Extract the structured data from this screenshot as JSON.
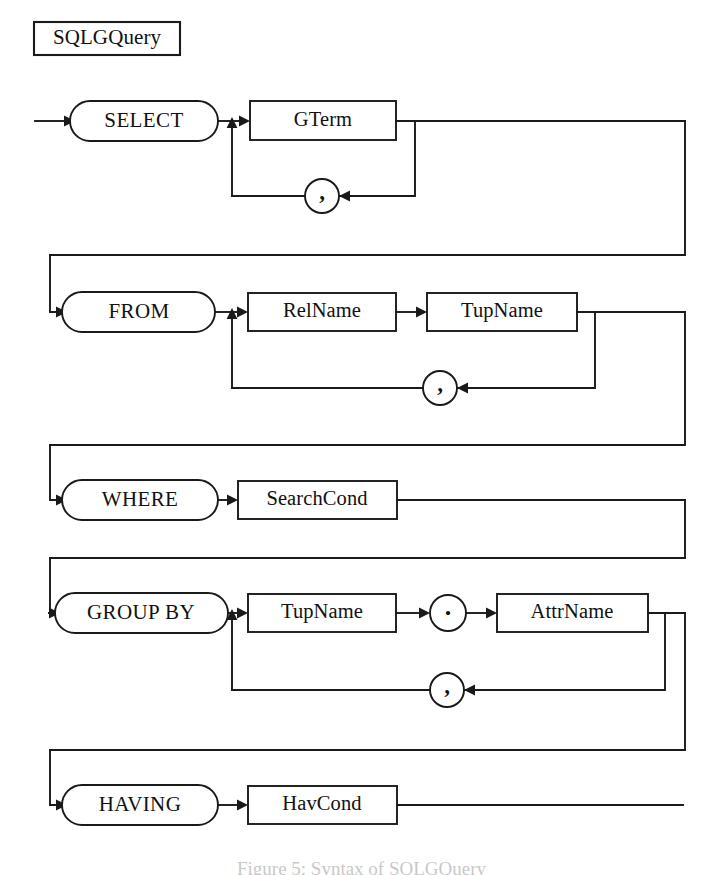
{
  "diagram": {
    "title": "SQLGQuery",
    "kind": "railroad-syntax-diagram",
    "caption": "Figure 5: Syntax of SQLGQuery",
    "ink_color": "#1a1a1a",
    "background_color": "#ffffff",
    "rows": [
      {
        "id": "select",
        "keyword": "SELECT",
        "items": [
          "GTerm"
        ],
        "separator": ",",
        "repeatable": true
      },
      {
        "id": "from",
        "keyword": "FROM",
        "items": [
          "RelName",
          "TupName"
        ],
        "separator": ",",
        "repeatable": true
      },
      {
        "id": "where",
        "keyword": "WHERE",
        "items": [
          "SearchCond"
        ],
        "separator": "",
        "repeatable": false
      },
      {
        "id": "group_by",
        "keyword": "GROUP BY",
        "items": [
          "TupName",
          ".",
          "AttrName"
        ],
        "separator": ",",
        "repeatable": true
      },
      {
        "id": "having",
        "keyword": "HAVING",
        "items": [
          "HavCond"
        ],
        "separator": "",
        "repeatable": false
      }
    ],
    "labels": {
      "title": "SQLGQuery",
      "select_keyword": "SELECT",
      "gterm": "GTerm",
      "select_comma": ",",
      "from_keyword": "FROM",
      "relname": "RelName",
      "tupname_from": "TupName",
      "from_comma": ",",
      "where_keyword": "WHERE",
      "searchcond": "SearchCond",
      "groupby_keyword": "GROUP BY",
      "tupname_group": "TupName",
      "dot": ".",
      "attrname": "AttrName",
      "group_comma": ",",
      "having_keyword": "HAVING",
      "havcond": "HavCond"
    }
  }
}
